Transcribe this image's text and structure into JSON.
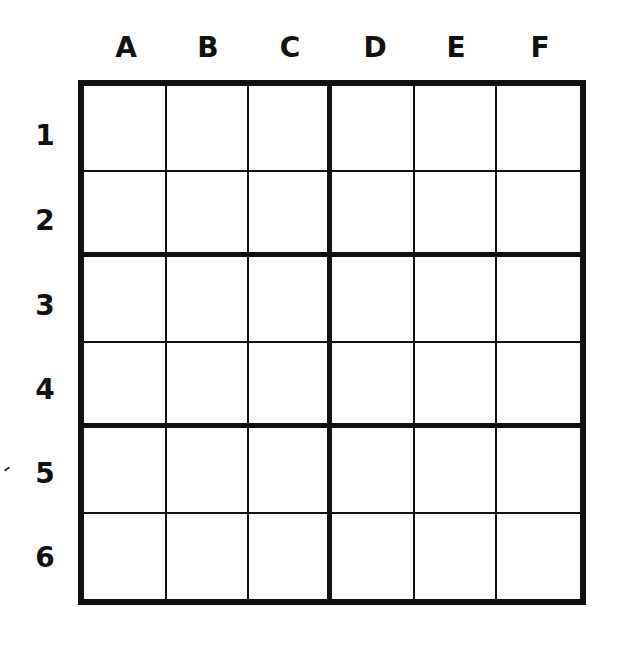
{
  "puzzle": {
    "type": "6x6 sudoku grid",
    "columns": [
      "A",
      "B",
      "C",
      "D",
      "E",
      "F"
    ],
    "rows": [
      "1",
      "2",
      "3",
      "4",
      "5",
      "6"
    ],
    "box_size": {
      "rows": 2,
      "cols": 3
    },
    "cells": [
      [
        "",
        "",
        "",
        "",
        "",
        ""
      ],
      [
        "",
        "",
        "",
        "",
        "",
        ""
      ],
      [
        "",
        "",
        "",
        "",
        "",
        ""
      ],
      [
        "",
        "",
        "",
        "",
        "",
        ""
      ],
      [
        "",
        "",
        "",
        "",
        "",
        ""
      ],
      [
        "",
        "",
        "",
        "",
        "",
        ""
      ]
    ]
  }
}
